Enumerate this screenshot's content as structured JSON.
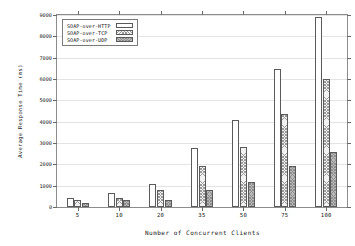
{
  "chart_data": {
    "type": "bar",
    "title": "",
    "xlabel": "Number of Concurrent Clients",
    "ylabel": "Average Response Time (ms)",
    "categories": [
      "5",
      "10",
      "20",
      "35",
      "50",
      "75",
      "100"
    ],
    "series": [
      {
        "name": "SOAP-over-HTTP",
        "values": [
          400,
          640,
          1070,
          2780,
          4090,
          6490,
          8890
        ]
      },
      {
        "name": "SOAP-over-TCP",
        "values": [
          310,
          400,
          800,
          1940,
          2790,
          4370,
          5990
        ]
      },
      {
        "name": "SOAP-over-UDP",
        "values": [
          210,
          320,
          330,
          790,
          1190,
          1930,
          2590
        ]
      }
    ],
    "ylim": [
      0,
      9000
    ],
    "yticks": [
      0,
      1000,
      2000,
      3000,
      4000,
      5000,
      6000,
      7000,
      8000,
      9000
    ],
    "ytick_labels": [
      "0",
      "1000",
      "2000",
      "3000",
      "4000",
      "5000",
      "6000",
      "7000",
      "8000",
      "9000"
    ],
    "grid": true,
    "legend_position": "top-left"
  },
  "legend": {
    "items": [
      {
        "label": "SOAP-over-HTTP",
        "swatch": "fill-http"
      },
      {
        "label": "SOAP-over-TCP",
        "swatch": "fill-tcp"
      },
      {
        "label": "SOAP-over-UDP",
        "swatch": "fill-udp"
      }
    ]
  }
}
